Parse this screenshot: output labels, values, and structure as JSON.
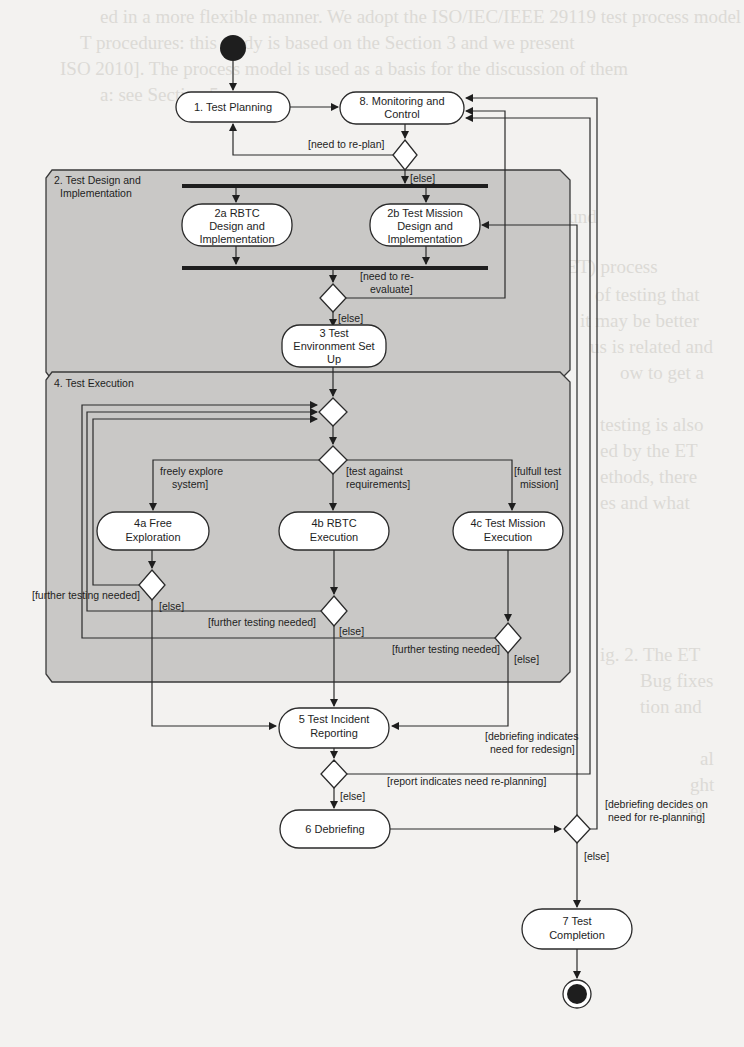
{
  "background_text_lines": [
    {
      "x": 100,
      "y": 22,
      "text": "ed in a more flexible manner. We adopt the ISO/IEC/IEEE 29119 test process model"
    },
    {
      "x": 80,
      "y": 48,
      "text": "T procedures: this study is based on the Section 3 and we present"
    },
    {
      "x": 60,
      "y": 74,
      "text": "ISO 2010]. The process model is used as a basis for the discussion of them"
    },
    {
      "x": 100,
      "y": 100,
      "text": "a: see Section 5."
    },
    {
      "x": 525,
      "y": 222,
      "text": "ckground"
    },
    {
      "x": 560,
      "y": 272,
      "text": "(ET) process"
    },
    {
      "x": 595,
      "y": 300,
      "text": "of testing that"
    },
    {
      "x": 580,
      "y": 326,
      "text": "it may be better"
    },
    {
      "x": 590,
      "y": 352,
      "text": "us is related and"
    },
    {
      "x": 620,
      "y": 378,
      "text": "ow to get a"
    },
    {
      "x": 600,
      "y": 430,
      "text": "testing is also"
    },
    {
      "x": 600,
      "y": 456,
      "text": "ed by the ET"
    },
    {
      "x": 600,
      "y": 482,
      "text": "ethods, there"
    },
    {
      "x": 600,
      "y": 508,
      "text": "es and what"
    },
    {
      "x": 600,
      "y": 660,
      "text": "ig. 2. The ET"
    },
    {
      "x": 640,
      "y": 686,
      "text": "Bug fixes"
    },
    {
      "x": 640,
      "y": 712,
      "text": "tion and"
    },
    {
      "x": 700,
      "y": 764,
      "text": "al"
    },
    {
      "x": 690,
      "y": 790,
      "text": "ght"
    },
    {
      "x": 690,
      "y": 816,
      "text": "et"
    }
  ],
  "diagram": {
    "start_node": "initial-node",
    "end_node": "final-node",
    "regions": [
      {
        "id": "region-test-design",
        "label_lines": [
          "2. Test Design and",
          "Implementation"
        ]
      },
      {
        "id": "region-test-execution",
        "label_lines": [
          "4. Test Execution"
        ]
      }
    ],
    "activities": {
      "test_planning": [
        "1. Test Planning"
      ],
      "monitoring_control": [
        "8. Monitoring and",
        "Control"
      ],
      "rbtc_design": [
        "2a RBTC",
        "Design and",
        "Implementation"
      ],
      "mission_design": [
        "2b Test Mission",
        "Design and",
        "Implementation"
      ],
      "env_setup": [
        "3 Test",
        "Environment Set",
        "Up"
      ],
      "free_exploration": [
        "4a Free",
        "Exploration"
      ],
      "rbtc_execution": [
        "4b RBTC",
        "Execution"
      ],
      "mission_execution": [
        "4c Test Mission",
        "Execution"
      ],
      "incident_reporting": [
        "5 Test Incident",
        "Reporting"
      ],
      "debriefing": [
        "6 Debriefing"
      ],
      "test_completion": [
        "7 Test",
        "Completion"
      ]
    },
    "guards": {
      "need_replan": "[need to re-plan]",
      "else_1": "[else]",
      "need_reevaluate": [
        "[need to re-",
        "evaluate]"
      ],
      "else_2": "[else]",
      "freely_explore": [
        "freely explore",
        "system]"
      ],
      "test_against_req": [
        "[test against",
        "requirements]"
      ],
      "fulfill_mission": [
        "[fulfull test",
        "mission]"
      ],
      "further_testing_a": "[further testing needed]",
      "else_a": "[else]",
      "further_testing_b": "[further testing needed]",
      "else_b": "[else]",
      "further_testing_c": "[further testing needed]",
      "else_c": "[else]",
      "debrief_redesign": [
        "[debriefing indicates",
        "need for redesign]"
      ],
      "report_replanning": "[report indicates need re-planning]",
      "else_5": "[else]",
      "debrief_replanning": [
        "[debriefing decides on",
        "need for re-planning]"
      ],
      "else_6": "[else]"
    },
    "colors": {
      "region_fill": "#c9c8c6",
      "node_fill": "#ffffff",
      "stroke": "#2a2a2a",
      "paper": "#f3f2f0"
    }
  }
}
